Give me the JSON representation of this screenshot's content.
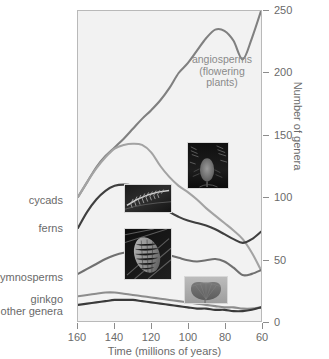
{
  "chart_data": {
    "type": "line",
    "title": "",
    "xlabel": "Time (millions of years)",
    "ylabel": "Number of genera",
    "xlim": [
      160,
      60
    ],
    "ylim": [
      0,
      250
    ],
    "x_ticks": [
      160,
      140,
      120,
      100,
      80,
      60
    ],
    "y_ticks": [
      0,
      50,
      100,
      150,
      200,
      250
    ],
    "x_axis_reversed": true,
    "grid": false,
    "legend": "inline-labels-left",
    "x": [
      160,
      155,
      150,
      145,
      140,
      135,
      130,
      125,
      120,
      115,
      110,
      105,
      100,
      95,
      90,
      85,
      80,
      75,
      70,
      65,
      60
    ],
    "series": [
      {
        "name": "angiosperms (flowering plants)",
        "label": "angiosperms",
        "color": "#808080",
        "label_position": "in-plot",
        "values": [
          100,
          112,
          124,
          133,
          140,
          147,
          155,
          163,
          170,
          178,
          188,
          200,
          208,
          218,
          228,
          235,
          234,
          226,
          211,
          228,
          250
        ]
      },
      {
        "name": "cycads",
        "label": "cycads",
        "color": "#a3a3a3",
        "label_position": "left-axis",
        "values": [
          100,
          112,
          123,
          132,
          139,
          142,
          143,
          142,
          136,
          125,
          116,
          109,
          104,
          98,
          91,
          85,
          79,
          73,
          66,
          55,
          41
        ]
      },
      {
        "name": "ferns",
        "label": "ferns",
        "color": "#3f3f3f",
        "label_position": "left-axis",
        "values": [
          75,
          88,
          98,
          105,
          109,
          110,
          109,
          106,
          101,
          94,
          88,
          84,
          81,
          79,
          77,
          74,
          70,
          66,
          63,
          66,
          72
        ]
      },
      {
        "name": "gymnosperms",
        "label": "gymnosperms",
        "color": "#707070",
        "label_position": "left-axis",
        "values": [
          38,
          42,
          46,
          50,
          53,
          55,
          56,
          57,
          57,
          55,
          53,
          51,
          49,
          48,
          49,
          50,
          48,
          43,
          37,
          38,
          41
        ]
      },
      {
        "name": "ginkgo",
        "label": "ginkgo",
        "color": "#8d8d8d",
        "label_position": "left-axis",
        "values": [
          20,
          21,
          22,
          23,
          23,
          22,
          21,
          20,
          19,
          18,
          17,
          16,
          15,
          14,
          13,
          12,
          11,
          11,
          10,
          10,
          11
        ]
      },
      {
        "name": "other genera",
        "label": "other genera",
        "color": "#3a3a3a",
        "label_position": "left-axis",
        "values": [
          13,
          14,
          15,
          16,
          17,
          17,
          17,
          16,
          15,
          14,
          13,
          12,
          11,
          10,
          10,
          9,
          9,
          8,
          8,
          9,
          11
        ]
      }
    ],
    "annotations": [
      {
        "name": "angiosperms-annotation",
        "lines": [
          "angiosperms",
          "(flowering",
          "plants)"
        ],
        "color": "#8a8a8a"
      }
    ],
    "inset_photos": [
      {
        "name": "fern-photo",
        "caption": "fern frond"
      },
      {
        "name": "angiosperm-photo",
        "caption": "flowering plant in forest"
      },
      {
        "name": "pinecone-photo",
        "caption": "conifer cone"
      },
      {
        "name": "ginkgo-leaf-photo",
        "caption": "ginkgo leaf"
      }
    ]
  },
  "axes": {
    "y_title": "Number of genera",
    "x_title": "Time (millions of years)",
    "y_tick_labels": [
      "0",
      "50",
      "100",
      "150",
      "200",
      "250"
    ],
    "x_tick_labels": [
      "160",
      "140",
      "120",
      "100",
      "80",
      "60"
    ]
  },
  "series_labels": {
    "cycads": "cycads",
    "ferns": "ferns",
    "gymnosperms": "gymnosperms",
    "ginkgo": "ginkgo",
    "other_genera": "other genera"
  },
  "annotation": {
    "line1": "angiosperms",
    "line2": "(flowering",
    "line3": "plants)"
  },
  "colors": {
    "plot_background": "#f2f2f2",
    "frame": "#b9b9b9",
    "text": "#6a6a6a",
    "angiosperms": "#808080",
    "cycads": "#a3a3a3",
    "ferns": "#3f3f3f",
    "gymnosperms": "#707070",
    "ginkgo": "#8d8d8d",
    "other_genera": "#3a3a3a"
  }
}
